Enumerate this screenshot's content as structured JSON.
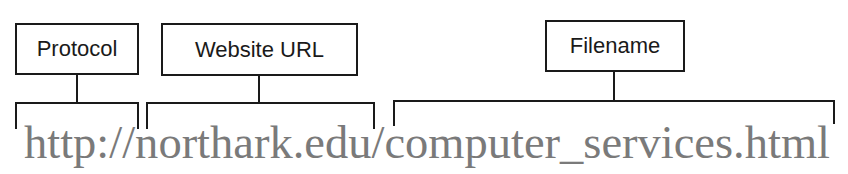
{
  "diagram": {
    "url": "http://northark.edu/computer_services.html",
    "parts": [
      {
        "label": "Protocol",
        "segment": "http://"
      },
      {
        "label": "Website URL",
        "segment": "northark.edu/"
      },
      {
        "label": "Filename",
        "segment": "computer_services.html"
      }
    ],
    "colors": {
      "box_border": "#1a1a1a",
      "label_text": "#1a1a1a",
      "url_text": "#7a7a7a",
      "background": "#ffffff"
    }
  }
}
